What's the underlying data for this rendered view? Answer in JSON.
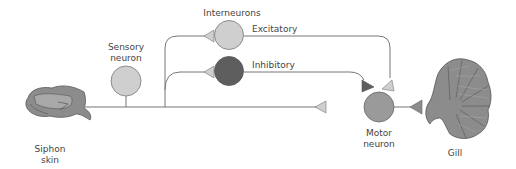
{
  "labels": {
    "interneurons": "Interneurons",
    "sensory_neuron": "Sensory\nneuron",
    "excitatory": "Excitatory",
    "inhibitory": "Inhibitory",
    "motor_neuron": "Motor\nneuron",
    "siphon_skin": "Siphon\nskin",
    "gill": "Gill"
  },
  "colors": {
    "line": "#777777",
    "light_neuron": "#cfcfcf",
    "inhibitory_neuron": "#5e5e5e",
    "motor_neuron": "#9a9a9a",
    "tissue": "#8c8c8c",
    "light_synapse": "#cfcfcf",
    "dark_synapse": "#5e5e5e"
  }
}
